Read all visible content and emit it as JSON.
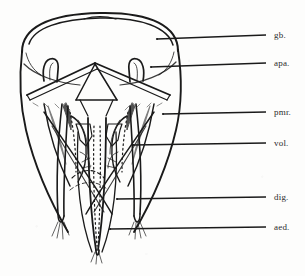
{
  "figure": {
    "type": "scientific-line-drawing",
    "background_color": "#fdfdfc",
    "ink_color": "#1a1a1a",
    "width": 305,
    "height": 276
  },
  "labels": [
    {
      "id": "gb",
      "text": "gb.",
      "meaning": "gonobase",
      "text_x": 274,
      "text_y": 31,
      "leader_x1": 266,
      "leader_y1": 35,
      "leader_x2": 157,
      "leader_y2": 39
    },
    {
      "id": "apa",
      "text": "apa.",
      "meaning": "apodeme",
      "text_x": 274,
      "text_y": 59,
      "leader_x1": 266,
      "leader_y1": 63,
      "leader_x2": 151,
      "leader_y2": 67
    },
    {
      "id": "pmr",
      "text": "pmr.",
      "meaning": "paramere",
      "text_x": 274,
      "text_y": 108,
      "leader_x1": 266,
      "leader_y1": 112,
      "leader_x2": 163,
      "leader_y2": 114
    },
    {
      "id": "vol",
      "text": "vol.",
      "meaning": "volsella",
      "text_x": 274,
      "text_y": 139,
      "leader_x1": 266,
      "leader_y1": 143,
      "leader_x2": 133,
      "leader_y2": 145
    },
    {
      "id": "dig",
      "text": "dig.",
      "meaning": "digitus",
      "text_x": 274,
      "text_y": 193,
      "leader_x1": 266,
      "leader_y1": 197,
      "leader_x2": 117,
      "leader_y2": 199
    },
    {
      "id": "aed",
      "text": "aed.",
      "meaning": "aedeagus",
      "text_x": 274,
      "text_y": 223,
      "leader_x1": 266,
      "leader_y1": 227,
      "leader_x2": 110,
      "leader_y2": 229
    }
  ],
  "structures": {
    "gonobase_dome": "large rounded dome occupying upper third",
    "apodeme_hooks": "two small upturned hook-shaped processes flanking the midline",
    "tent_ridge": "inverted-V ridge spanning the width below the dome",
    "parameres": "two broad lateral lobes tapering toward the base",
    "volsellae": "paired inner sclerites with dotted internal outlines",
    "digiti": "slender paired arms crossing outward to bristled tips",
    "aedeagus": "median V-shaped rod at the lower centre",
    "bristle_tufts": 3
  }
}
